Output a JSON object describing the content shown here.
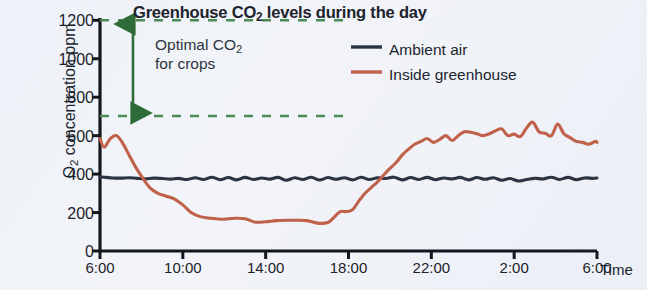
{
  "chart_data": {
    "type": "line",
    "title": "Greenhouse CO2 levels during the day",
    "title_parts": {
      "before": "Greenhouse CO",
      "sub": "2",
      "after": " levels during the day"
    },
    "xlabel": "Time",
    "ylabel": "O2 concentration ppm",
    "ylabel_parts": {
      "before": "O",
      "sub": "2",
      "after": " concentration ppm"
    },
    "xlim": [
      6,
      30
    ],
    "ylim": [
      0,
      1200
    ],
    "grid": false,
    "legend_position": "top-right",
    "ytick_labels": [
      "1200",
      "1000",
      "800",
      "600",
      "400",
      "200",
      "0"
    ],
    "ytick_values": [
      1200,
      1000,
      800,
      600,
      400,
      200,
      0
    ],
    "xtick_labels": [
      "6:00",
      "10:00",
      "14:00",
      "18:00",
      "22:00",
      "2:00",
      "6:00"
    ],
    "xtick_values": [
      6,
      10,
      14,
      18,
      22,
      26,
      30
    ],
    "annotations": [
      {
        "name": "optimal-co2-band",
        "text": "Optimal CO2 for crops",
        "text_parts": {
          "before": "Optimal CO",
          "sub": "2",
          "after": ""
        },
        "text_line2": "for crops",
        "range_ppm": [
          700,
          1200
        ],
        "color": "#3f7a46",
        "style": "double-headed-arrow-with-dashed-bounds"
      }
    ],
    "series": [
      {
        "name": "Ambient air",
        "color": "#2a3442",
        "x": [
          6.0,
          6.3,
          6.6,
          7.0,
          7.4,
          7.8,
          8.2,
          8.6,
          9.0,
          9.4,
          9.8,
          10.2,
          10.6,
          11.0,
          11.4,
          11.8,
          12.2,
          12.6,
          13.0,
          13.4,
          13.8,
          14.2,
          14.6,
          15.0,
          15.4,
          15.8,
          16.2,
          16.6,
          17.0,
          17.4,
          17.8,
          18.2,
          18.6,
          19.0,
          19.4,
          19.8,
          20.2,
          20.6,
          21.0,
          21.4,
          21.8,
          22.2,
          22.6,
          23.0,
          23.4,
          23.8,
          24.2,
          24.6,
          25.0,
          25.4,
          25.8,
          26.2,
          26.6,
          27.0,
          27.4,
          27.8,
          28.2,
          28.6,
          29.0,
          29.4,
          29.8,
          30.0
        ],
        "values": [
          385,
          383,
          380,
          379,
          381,
          378,
          376,
          379,
          377,
          374,
          378,
          372,
          381,
          372,
          384,
          371,
          382,
          370,
          383,
          372,
          380,
          374,
          383,
          368,
          381,
          372,
          384,
          369,
          382,
          373,
          381,
          370,
          384,
          372,
          381,
          377,
          384,
          370,
          382,
          372,
          383,
          371,
          380,
          375,
          383,
          370,
          382,
          373,
          381,
          368,
          377,
          364,
          372,
          378,
          375,
          384,
          372,
          383,
          371,
          380,
          378,
          380
        ]
      },
      {
        "name": "Inside greenhouse",
        "color": "#c0614a",
        "x": [
          6.0,
          6.2,
          6.5,
          6.8,
          7.1,
          7.4,
          7.7,
          8.0,
          8.4,
          8.8,
          9.2,
          9.6,
          10.0,
          10.4,
          10.8,
          11.2,
          11.6,
          12.0,
          12.5,
          13.0,
          13.5,
          14.0,
          14.5,
          15.0,
          15.5,
          16.0,
          16.5,
          17.0,
          17.3,
          17.6,
          17.9,
          18.2,
          18.5,
          18.8,
          19.1,
          19.4,
          19.7,
          20.0,
          20.3,
          20.6,
          20.9,
          21.2,
          21.5,
          21.8,
          22.1,
          22.4,
          22.7,
          23.0,
          23.3,
          23.6,
          23.9,
          24.2,
          24.5,
          24.8,
          25.1,
          25.4,
          25.7,
          26.0,
          26.3,
          26.6,
          26.9,
          27.2,
          27.5,
          27.8,
          28.1,
          28.4,
          28.7,
          29.0,
          29.3,
          29.6,
          29.9,
          30.0
        ],
        "values": [
          585,
          540,
          585,
          600,
          560,
          500,
          440,
          390,
          330,
          300,
          285,
          270,
          240,
          200,
          180,
          172,
          168,
          165,
          170,
          168,
          150,
          152,
          158,
          160,
          160,
          158,
          145,
          148,
          175,
          205,
          205,
          215,
          260,
          300,
          330,
          360,
          395,
          430,
          460,
          500,
          530,
          555,
          570,
          585,
          565,
          580,
          600,
          575,
          600,
          620,
          618,
          610,
          600,
          610,
          625,
          635,
          600,
          608,
          595,
          640,
          670,
          620,
          612,
          600,
          660,
          610,
          590,
          570,
          565,
          555,
          570,
          565
        ]
      }
    ]
  },
  "legend": {
    "entries": [
      {
        "label": "Ambient air",
        "color": "#2a3442"
      },
      {
        "label": "Inside greenhouse",
        "color": "#c0614a"
      }
    ]
  },
  "axes": {
    "x_title": "Time",
    "y_title_before": "O",
    "y_title_sub": "2",
    "y_title_after": " concentration ppm"
  },
  "title": {
    "before": "Greenhouse CO",
    "sub": "2",
    "after": " levels during the day"
  },
  "annotation": {
    "line1_before": "Optimal CO",
    "line1_sub": "2",
    "line2": "for crops"
  }
}
